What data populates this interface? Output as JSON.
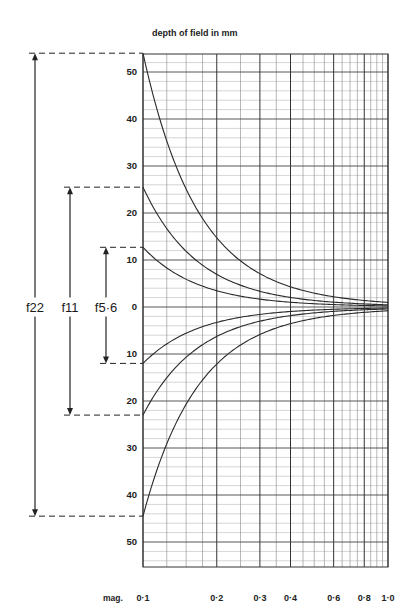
{
  "chart_data": {
    "type": "line",
    "title": "depth of field in mm",
    "xlabel": "mag.",
    "ylabel": "depth of field in mm",
    "x_scale": "log",
    "xlim": [
      0.1,
      1.0
    ],
    "ylim": [
      -55,
      54
    ],
    "grid": true,
    "x_ticks": [
      {
        "value": 0.1,
        "label": "0·1"
      },
      {
        "value": 0.2,
        "label": "0·2"
      },
      {
        "value": 0.3,
        "label": "0·3"
      },
      {
        "value": 0.4,
        "label": "0·4"
      },
      {
        "value": 0.6,
        "label": "0·6"
      },
      {
        "value": 0.8,
        "label": "0·8"
      },
      {
        "value": 1.0,
        "label": "1·0"
      }
    ],
    "y_ticks": [
      {
        "value": 50,
        "label": "50"
      },
      {
        "value": 40,
        "label": "40"
      },
      {
        "value": 30,
        "label": "30"
      },
      {
        "value": 20,
        "label": "20"
      },
      {
        "value": 10,
        "label": "10"
      },
      {
        "value": 0,
        "label": "0"
      },
      {
        "value": -10,
        "label": "10"
      },
      {
        "value": -20,
        "label": "20"
      },
      {
        "value": -30,
        "label": "30"
      },
      {
        "value": -40,
        "label": "40"
      },
      {
        "value": -50,
        "label": "50"
      }
    ],
    "series": [
      {
        "name": "f22",
        "label": "f22",
        "far_at_0_1": 54,
        "near_at_0_1": -44.5,
        "x": [
          0.1,
          0.15,
          0.2,
          0.3,
          0.4,
          0.6,
          0.8,
          1.0
        ],
        "far": [
          54,
          25.3,
          14.8,
          7.1,
          4.3,
          2.2,
          1.4,
          0.5
        ],
        "near": [
          -44.5,
          -20.8,
          -12.2,
          -5.8,
          -3.5,
          -1.8,
          -1.1,
          -0.4
        ]
      },
      {
        "name": "f11",
        "label": "f11",
        "far_at_0_1": 25.5,
        "near_at_0_1": -23,
        "x": [
          0.1,
          0.15,
          0.2,
          0.3,
          0.4,
          0.6,
          0.8,
          1.0
        ],
        "far": [
          25.5,
          12.0,
          7.0,
          3.4,
          2.0,
          1.0,
          0.65,
          0.3
        ],
        "near": [
          -23,
          -10.8,
          -6.3,
          -3.0,
          -1.8,
          -0.95,
          -0.6,
          -0.25
        ]
      },
      {
        "name": "f5.6",
        "label": "f5·6",
        "far_at_0_1": 12.7,
        "near_at_0_1": -12,
        "x": [
          0.1,
          0.15,
          0.2,
          0.3,
          0.4,
          0.6,
          0.8,
          1.0
        ],
        "far": [
          12.7,
          6.0,
          3.5,
          1.7,
          1.0,
          0.5,
          0.33,
          0.15
        ],
        "near": [
          -12,
          -5.6,
          -3.3,
          -1.6,
          -0.95,
          -0.5,
          -0.3,
          -0.12
        ]
      }
    ],
    "annotations": [
      {
        "label": "f22",
        "top": 54,
        "bottom": -44.5
      },
      {
        "label": "f11",
        "top": 25.5,
        "bottom": -23
      },
      {
        "label": "f5·6",
        "top": 12.7,
        "bottom": -12
      }
    ]
  },
  "labels": {
    "title": "depth of field in mm",
    "mag": "mag."
  }
}
